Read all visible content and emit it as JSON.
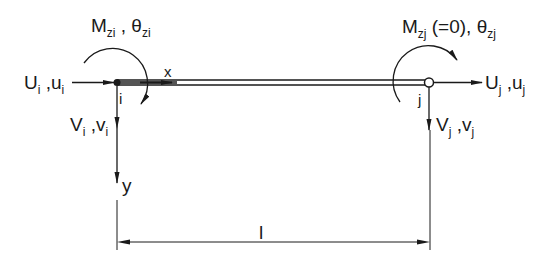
{
  "diagram": {
    "colors": {
      "line": "#1a1a1a",
      "background": "#ffffff"
    },
    "nodes": [
      {
        "id": "i",
        "label": "i",
        "type": "rigid"
      },
      {
        "id": "j",
        "label": "j",
        "type": "hinge"
      }
    ],
    "labels": {
      "moment_i": {
        "main": "M",
        "sub": "zi",
        "sep": " , ",
        "main2": "θ",
        "sub2": "zi"
      },
      "moment_j": {
        "main": "M",
        "sub": "zj",
        "mid": " (=0), ",
        "main2": "θ",
        "sub2": "zj"
      },
      "axial_i": {
        "main": "U",
        "sub": "i",
        "sep": " ,",
        "main2": "u",
        "sub2": "i"
      },
      "axial_j": {
        "main": "U",
        "sub": "j",
        "sep": " ,",
        "main2": "u",
        "sub2": "j"
      },
      "shear_i": {
        "main": "V",
        "sub": "i",
        "sep": " ,",
        "main2": "v",
        "sub2": "i"
      },
      "shear_j": {
        "main": "V",
        "sub": "j",
        "sep": " ,",
        "main2": "v",
        "sub2": "j"
      },
      "node_i": "i",
      "node_j": "j",
      "axis_x": "x",
      "axis_y": "y",
      "length": "l"
    }
  }
}
